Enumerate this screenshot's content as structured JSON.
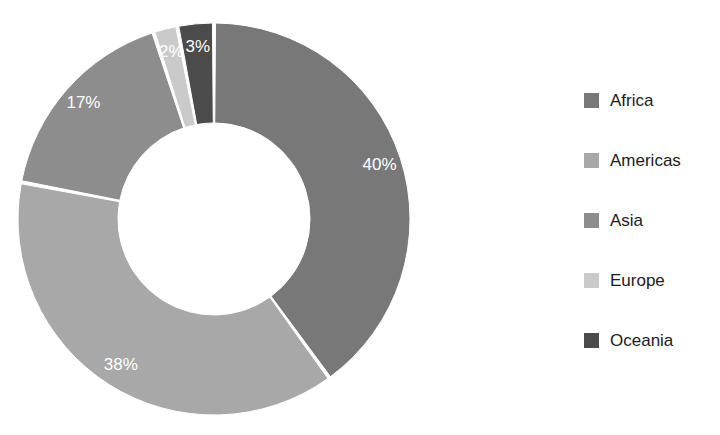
{
  "background_color": "#ffffff",
  "chart_data": {
    "type": "pie",
    "variant": "donut",
    "title": "",
    "subtitle": "",
    "xlabel": "",
    "ylabel": "",
    "grid": false,
    "legend_position": "right",
    "start_angle_deg": 0,
    "direction": "clockwise",
    "inner_radius_ratio": 0.49,
    "value_unit": "%",
    "label_text_color": "#ffffff",
    "slice_border_color": "#ffffff",
    "categories": [
      "Africa",
      "Americas",
      "Asia",
      "Europe",
      "Oceania"
    ],
    "values": [
      40,
      38,
      17,
      2,
      3
    ],
    "labels": [
      "40%",
      "38%",
      "17%",
      "2%",
      "3%"
    ],
    "colors": [
      "#787878",
      "#a8a8a8",
      "#8d8d8d",
      "#cacaca",
      "#4b4b4b"
    ],
    "slices": [
      {
        "name": "Africa",
        "value": 40,
        "label": "40%",
        "color": "#787878"
      },
      {
        "name": "Americas",
        "value": 38,
        "label": "38%",
        "color": "#a8a8a8"
      },
      {
        "name": "Asia",
        "value": 17,
        "label": "17%",
        "color": "#8d8d8d"
      },
      {
        "name": "Europe",
        "value": 2,
        "label": "2%",
        "color": "#cacaca"
      },
      {
        "name": "Oceania",
        "value": 3,
        "label": "3%",
        "color": "#4b4b4b"
      }
    ]
  },
  "legend": {
    "items": [
      {
        "label": "Africa",
        "color": "#787878"
      },
      {
        "label": "Americas",
        "color": "#a8a8a8"
      },
      {
        "label": "Asia",
        "color": "#8d8d8d"
      },
      {
        "label": "Europe",
        "color": "#cacaca"
      },
      {
        "label": "Oceania",
        "color": "#4b4b4b"
      }
    ]
  }
}
